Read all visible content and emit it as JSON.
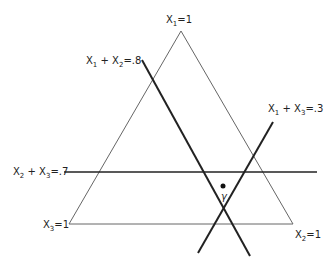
{
  "diagram": {
    "type": "simplex-triangle",
    "vertices": {
      "top": {
        "label_var": "X",
        "label_sub": "1",
        "label_eq": "=1",
        "x": 181,
        "y": 31
      },
      "bottom_left": {
        "label_var": "X",
        "label_sub": "3",
        "label_eq": "=1",
        "x": 69,
        "y": 224
      },
      "bottom_right": {
        "label_var": "X",
        "label_sub": "2",
        "label_eq": "=1",
        "x": 293,
        "y": 224
      }
    },
    "constraint_lines": [
      {
        "id": "x1x2",
        "a": "X",
        "a_sub": "1",
        "b": "X",
        "b_sub": "2",
        "value": "=.8",
        "x1": 142,
        "y1": 60,
        "x2": 250,
        "y2": 256
      },
      {
        "id": "x1x3",
        "a": "X",
        "a_sub": "1",
        "b": "X",
        "b_sub": "3",
        "value": "=.3",
        "x1": 273,
        "y1": 122,
        "x2": 198,
        "y2": 253
      },
      {
        "id": "x2x3",
        "a": "X",
        "a_sub": "2",
        "b": "X",
        "b_sub": "3",
        "value": "=.7",
        "x1": 64,
        "y1": 172,
        "x2": 317,
        "y2": 172
      }
    ],
    "point": {
      "label": "γ",
      "x": 223,
      "y": 186
    },
    "colors": {
      "triangle": "#555555",
      "lines": "#222222",
      "text": "#222222"
    }
  }
}
